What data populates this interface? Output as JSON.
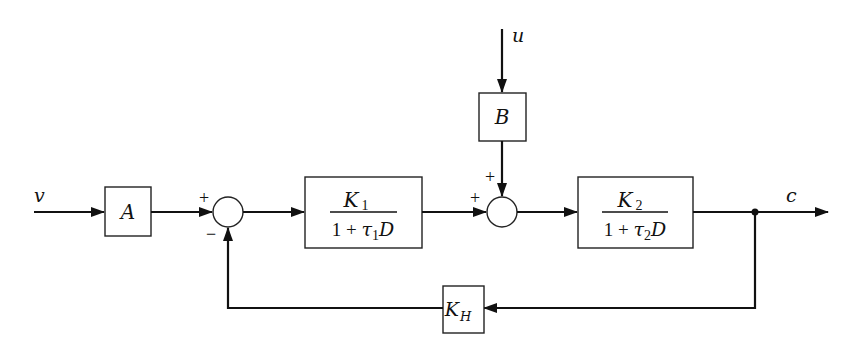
{
  "diagram": {
    "type": "block-diagram",
    "inputs": {
      "v": "v",
      "u": "u"
    },
    "output": "c",
    "blocks": {
      "A": {
        "label": "A"
      },
      "B": {
        "label": "B"
      },
      "G1": {
        "num_var": "K",
        "num_sub": "1",
        "den_prefix": "1 + ",
        "den_tau": "τ",
        "den_sub": "1",
        "den_suffix": "D"
      },
      "G2": {
        "num_var": "K",
        "num_sub": "2",
        "den_prefix": "1 + ",
        "den_tau": "τ",
        "den_sub": "2",
        "den_suffix": "D"
      },
      "H": {
        "var": "K",
        "sub": "H"
      }
    },
    "junctions": {
      "sum1": {
        "sign_top": "+",
        "sign_bottom": "−"
      },
      "sum2": {
        "sign_left": "+",
        "sign_top": "+"
      }
    },
    "colors": {
      "line": "#111111",
      "background": "#ffffff"
    }
  }
}
